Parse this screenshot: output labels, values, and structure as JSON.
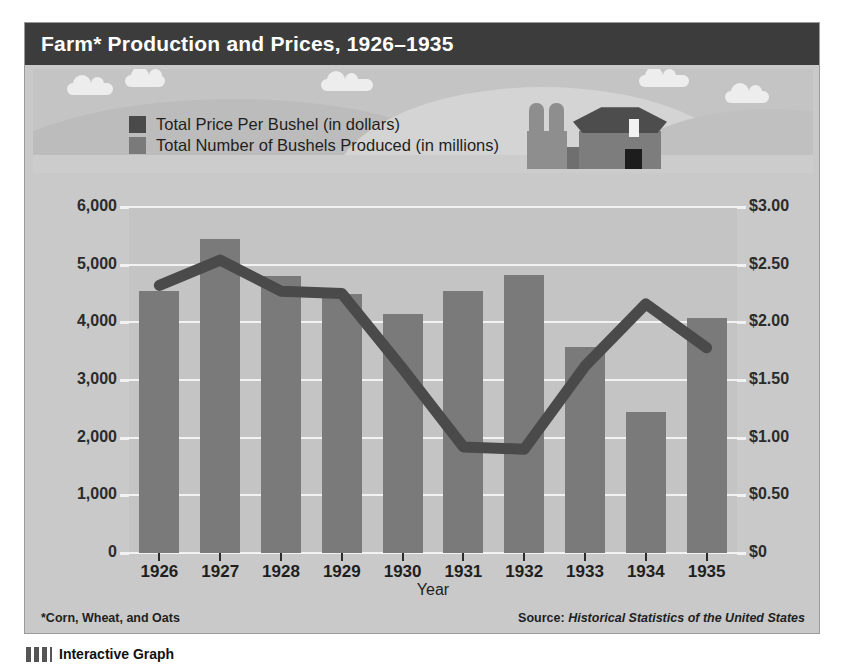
{
  "title": "Farm* Production and Prices, 1926–1935",
  "legend": {
    "items": [
      {
        "label": "Total Price Per Bushel (in dollars)",
        "color": "#4a4a4a",
        "series": "price"
      },
      {
        "label": "Total Number of Bushels Produced (in millions)",
        "color": "#7a7a7a",
        "series": "bushels"
      }
    ]
  },
  "footnote": "*Corn, Wheat, and Oats",
  "source_prefix": "Source:",
  "source_title": "Historical Statistics of the United States",
  "caption": "Interactive Graph",
  "axes": {
    "left_ticks": [
      "6,000",
      "5,000",
      "4,000",
      "3,000",
      "2,000",
      "1,000",
      "0"
    ],
    "right_ticks": [
      "$3.00",
      "$2.50",
      "$2.00",
      "$1.50",
      "$1.00",
      "$0.50",
      "$0"
    ],
    "x_title": "Year"
  },
  "chart_data": {
    "type": "bar",
    "title": "Farm* Production and Prices, 1926–1935",
    "xlabel": "Year",
    "ylabel": "Total Number of Bushels Produced (in millions)",
    "y2label": "Total Price Per Bushel (in dollars)",
    "categories": [
      "1926",
      "1927",
      "1928",
      "1929",
      "1930",
      "1931",
      "1932",
      "1933",
      "1934",
      "1935"
    ],
    "ylim": [
      0,
      6000
    ],
    "y2lim": [
      0,
      3.0
    ],
    "grid": true,
    "legend_position": "top-left",
    "series": [
      {
        "name": "Total Number of Bushels Produced (in millions)",
        "type": "bar",
        "axis": "left",
        "color": "#7a7a7a",
        "values": [
          4550,
          5450,
          4800,
          4500,
          4150,
          4550,
          4820,
          3580,
          2450,
          4070
        ]
      },
      {
        "name": "Total Price Per Bushel (in dollars)",
        "type": "line",
        "axis": "right",
        "color": "#4a4a4a",
        "values": [
          2.32,
          2.54,
          2.27,
          2.25,
          1.6,
          0.92,
          0.9,
          1.62,
          2.16,
          1.78
        ]
      }
    ]
  }
}
